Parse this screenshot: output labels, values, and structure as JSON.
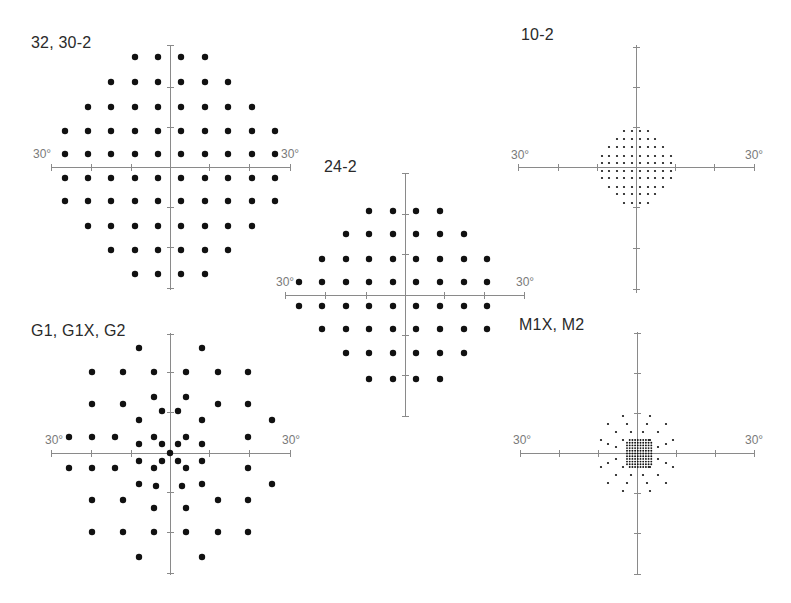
{
  "figure": {
    "panels": [
      {
        "id": "p32",
        "title": "32, 30-2",
        "title_pos": [
          31,
          34
        ],
        "center": [
          170,
          167
        ],
        "axis_h": [
          51,
          290
        ],
        "axis_v": [
          45,
          290
        ],
        "ticks_h": [
          51,
          91,
          131,
          209,
          249,
          290
        ],
        "ticks_v": [
          45,
          87,
          127,
          207,
          247,
          288
        ],
        "deg_left": {
          "text": "30°",
          "pos": [
            33,
            147
          ]
        },
        "deg_right": {
          "text": "30°",
          "pos": [
            281,
            147
          ]
        },
        "dot_r": 3.2,
        "rows": [
          {
            "y": 57,
            "x": [
              135,
              158,
              181,
              205
            ]
          },
          {
            "y": 82,
            "x": [
              111,
              135,
              158,
              181,
              205,
              228
            ]
          },
          {
            "y": 107,
            "x": [
              88,
              111,
              135,
              158,
              181,
              205,
              228,
              252
            ]
          },
          {
            "y": 131,
            "x": [
              65,
              88,
              111,
              135,
              158,
              181,
              205,
              228,
              252,
              275
            ]
          },
          {
            "y": 154,
            "x": [
              65,
              88,
              111,
              135,
              158,
              181,
              205,
              228,
              252,
              275
            ]
          },
          {
            "y": 178,
            "x": [
              65,
              88,
              111,
              135,
              158,
              181,
              205,
              228,
              252,
              275
            ]
          },
          {
            "y": 201,
            "x": [
              65,
              88,
              111,
              135,
              158,
              181,
              205,
              228,
              252,
              275
            ]
          },
          {
            "y": 226,
            "x": [
              88,
              111,
              135,
              158,
              181,
              205,
              228,
              252
            ]
          },
          {
            "y": 250,
            "x": [
              111,
              135,
              158,
              181,
              205,
              228
            ]
          },
          {
            "y": 274,
            "x": [
              135,
              158,
              181,
              205
            ]
          }
        ]
      },
      {
        "id": "p24",
        "title": "24-2",
        "title_pos": [
          324,
          158
        ],
        "center": [
          405,
          295
        ],
        "axis_h": [
          285,
          524
        ],
        "axis_v": [
          173,
          417
        ],
        "ticks_h": [
          285,
          325,
          366,
          444,
          484,
          524
        ],
        "ticks_v": [
          173,
          214,
          254,
          335,
          375,
          416
        ],
        "deg_left": {
          "text": "30°",
          "pos": [
            276,
            275
          ]
        },
        "deg_right": {
          "text": "30°",
          "pos": [
            516,
            275
          ]
        },
        "dot_r": 3.2,
        "rows": [
          {
            "y": 211,
            "x": [
              369,
              393,
              416,
              440
            ]
          },
          {
            "y": 234,
            "x": [
              346,
              369,
              393,
              416,
              440,
              464
            ]
          },
          {
            "y": 259,
            "x": [
              322,
              346,
              369,
              393,
              416,
              440,
              464,
              487
            ]
          },
          {
            "y": 282,
            "x": [
              299,
              322,
              346,
              369,
              393,
              416,
              440,
              464,
              487
            ]
          },
          {
            "y": 306,
            "x": [
              299,
              322,
              346,
              369,
              393,
              416,
              440,
              464,
              487
            ]
          },
          {
            "y": 329,
            "x": [
              322,
              346,
              369,
              393,
              416,
              440,
              464,
              487
            ]
          },
          {
            "y": 353,
            "x": [
              346,
              369,
              393,
              416,
              440,
              464
            ]
          },
          {
            "y": 379,
            "x": [
              369,
              393,
              416,
              440
            ]
          }
        ]
      },
      {
        "id": "p10",
        "title": "10-2",
        "title_pos": [
          521,
          26
        ],
        "center": [
          636,
          167
        ],
        "axis_h": [
          518,
          755
        ],
        "axis_v": [
          45,
          293
        ],
        "ticks_h": [
          518,
          558,
          597,
          675,
          714,
          754
        ],
        "ticks_v": [
          47,
          87,
          127,
          207,
          248,
          289
        ],
        "deg_left": {
          "text": "30°",
          "pos": [
            511,
            148
          ]
        },
        "deg_right": {
          "text": "30°",
          "pos": [
            745,
            148
          ]
        },
        "dot_r": 1.1,
        "rows": [
          {
            "y": 131,
            "x": [
              624,
              632,
              640,
              648
            ]
          },
          {
            "y": 139,
            "x": [
              617,
              624,
              632,
              640,
              648,
              655
            ]
          },
          {
            "y": 147,
            "x": [
              609,
              617,
              624,
              632,
              640,
              648,
              655,
              663
            ]
          },
          {
            "y": 156,
            "x": [
              602,
              609,
              617,
              624,
              632,
              640,
              648,
              655,
              663,
              671
            ]
          },
          {
            "y": 163,
            "x": [
              602,
              609,
              617,
              624,
              632,
              640,
              648,
              655,
              663,
              671
            ]
          },
          {
            "y": 171,
            "x": [
              602,
              609,
              617,
              624,
              632,
              640,
              648,
              655,
              663,
              671
            ]
          },
          {
            "y": 178,
            "x": [
              602,
              609,
              617,
              624,
              632,
              640,
              648,
              655,
              663,
              671
            ]
          },
          {
            "y": 187,
            "x": [
              609,
              617,
              624,
              632,
              640,
              648,
              655,
              663
            ]
          },
          {
            "y": 194,
            "x": [
              617,
              624,
              632,
              640,
              648,
              655
            ]
          },
          {
            "y": 203,
            "x": [
              624,
              632,
              640,
              648
            ]
          }
        ]
      },
      {
        "id": "pg1",
        "title": "G1, G1X, G2",
        "title_pos": [
          31,
          322
        ],
        "center": [
          170,
          453
        ],
        "axis_h": [
          51,
          290
        ],
        "axis_v": [
          333,
          575
        ],
        "ticks_h": [
          51,
          91,
          131,
          209,
          249,
          290
        ],
        "ticks_v": [
          334,
          372,
          412,
          492,
          532,
          573
        ],
        "deg_left": {
          "text": "30°",
          "pos": [
            45,
            433
          ]
        },
        "deg_right": {
          "text": "30°",
          "pos": [
            282,
            433
          ]
        },
        "dot_r": 3.2,
        "rows": [
          {
            "y": 348,
            "x": [
              139,
              202
            ]
          },
          {
            "y": 372,
            "x": [
              92,
              123,
              154,
              186,
              218,
              248
            ]
          },
          {
            "y": 397,
            "x": [
              154,
              186
            ]
          },
          {
            "y": 404,
            "x": [
              92,
              123,
              218,
              248
            ]
          },
          {
            "y": 411,
            "x": [
              162,
              178
            ]
          },
          {
            "y": 420,
            "x": [
              139,
              202,
              272
            ]
          },
          {
            "y": 437,
            "x": [
              69,
              92,
              115,
              154,
              186,
              248
            ]
          },
          {
            "y": 444,
            "x": [
              139,
              162,
              178,
              202
            ]
          },
          {
            "y": 453,
            "x": [
              170
            ]
          },
          {
            "y": 461,
            "x": [
              139,
              162,
              178,
              202
            ]
          },
          {
            "y": 468,
            "x": [
              69,
              92,
              115,
              154,
              186,
              248
            ]
          },
          {
            "y": 484,
            "x": [
              139,
              202,
              272
            ]
          },
          {
            "y": 486,
            "x": [
              156,
              182
            ]
          },
          {
            "y": 500,
            "x": [
              92,
              123,
              218,
              248
            ]
          },
          {
            "y": 508,
            "x": [
              154,
              186
            ]
          },
          {
            "y": 532,
            "x": [
              92,
              123,
              154,
              186,
              218,
              248
            ]
          },
          {
            "y": 557,
            "x": [
              139,
              202
            ]
          }
        ]
      },
      {
        "id": "pm1",
        "title": "M1X, M2",
        "title_pos": [
          519,
          316
        ],
        "center": [
          637,
          453
        ],
        "axis_h": [
          520,
          755
        ],
        "axis_v": [
          332,
          575
        ],
        "ticks_h": [
          520,
          559,
          598,
          676,
          715,
          754
        ],
        "ticks_v": [
          333,
          373,
          413,
          493,
          533,
          574
        ],
        "deg_left": {
          "text": "30°",
          "pos": [
            513,
            433
          ]
        },
        "deg_right": {
          "text": "30°",
          "pos": [
            745,
            433
          ]
        },
        "dot_r": 1.1,
        "rows": [
          {
            "y": 416,
            "x": [
              623,
              650
            ]
          },
          {
            "y": 424,
            "x": [
              608,
              627,
              647,
              666
            ]
          },
          {
            "y": 432,
            "x": [
              616,
              631,
              643,
              658
            ]
          },
          {
            "y": 440,
            "x": [
              601,
              623,
              650,
              673
            ]
          },
          {
            "y": 444,
            "x": [
              608,
              666
            ]
          },
          {
            "y": 447,
            "x": [
              616,
              658
            ]
          },
          {
            "y": 459,
            "x": [
              616,
              658
            ]
          },
          {
            "y": 463,
            "x": [
              608,
              666
            ]
          },
          {
            "y": 467,
            "x": [
              601,
              623,
              650,
              673
            ]
          },
          {
            "y": 475,
            "x": [
              616,
              631,
              643,
              658
            ]
          },
          {
            "y": 483,
            "x": [
              608,
              627,
              647,
              666
            ]
          },
          {
            "y": 491,
            "x": [
              623,
              650
            ]
          }
        ],
        "dense_grid": {
          "x0": 627,
          "x1": 650,
          "y0": 440,
          "y1": 467,
          "step": 2.7,
          "dot_r": 0.95,
          "trim_corners": true
        }
      }
    ],
    "caption": {
      "text": "",
      "truncated": true
    }
  }
}
